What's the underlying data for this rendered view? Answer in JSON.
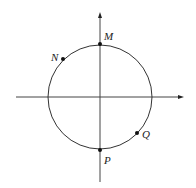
{
  "diagram": {
    "type": "unit-circle",
    "center": [
      100,
      97
    ],
    "radius": 52,
    "stroke_color": "#333333",
    "axes": {
      "x_axis": {
        "from": [
          16,
          97
        ],
        "to": [
          183,
          97
        ],
        "arrow": "right"
      },
      "y_axis": {
        "from": [
          100,
          182
        ],
        "to": [
          100,
          13
        ],
        "arrow": "top"
      }
    },
    "points": [
      {
        "label": "M",
        "x": 100,
        "y": 44,
        "label_x": 104,
        "label_y": 40
      },
      {
        "label": "N",
        "x": 63,
        "y": 59,
        "label_x": 50,
        "label_y": 61
      },
      {
        "label": "Q",
        "x": 137,
        "y": 133,
        "label_x": 142,
        "label_y": 138
      },
      {
        "label": "P",
        "x": 100,
        "y": 150,
        "label_x": 104,
        "label_y": 164
      }
    ]
  }
}
